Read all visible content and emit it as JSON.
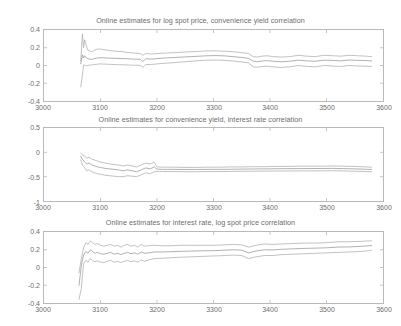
{
  "figure": {
    "width": 401,
    "height": 326,
    "background": "#ffffff",
    "axis_color": "#b9b9b9",
    "text_color": "#6d6d6d"
  },
  "chart_data": [
    {
      "type": "line",
      "title": "Online estimates for log spot price, convenience yield correlation",
      "xlabel": "",
      "ylabel": "",
      "xlim": [
        3000,
        3600
      ],
      "ylim": [
        -0.4,
        0.4
      ],
      "xticks": [
        3000,
        3100,
        3200,
        3300,
        3400,
        3500,
        3600
      ],
      "xticklabels": [
        "3000",
        "3100",
        "3200",
        "3300",
        "3400",
        "3500",
        "3600"
      ],
      "yticks": [
        -0.4,
        -0.2,
        0,
        0.2,
        0.4
      ],
      "yticklabels": [
        "-0.4",
        "-0.2",
        "0",
        "0.2",
        "0.4"
      ],
      "grid": false,
      "legend": "none",
      "line_color": "#9a9a9a",
      "series": [
        {
          "name": "upper confidence band",
          "color": "#a8a8a8",
          "x": [
            3065,
            3068,
            3070,
            3072,
            3075,
            3078,
            3082,
            3086,
            3090,
            3095,
            3100,
            3110,
            3120,
            3130,
            3140,
            3150,
            3160,
            3170,
            3175,
            3180,
            3190,
            3200,
            3215,
            3230,
            3245,
            3260,
            3275,
            3290,
            3305,
            3320,
            3335,
            3350,
            3362,
            3370,
            3378,
            3385,
            3395,
            3405,
            3420,
            3435,
            3450,
            3465,
            3480,
            3495,
            3510,
            3525,
            3540,
            3555,
            3570,
            3580
          ],
          "values": [
            0.05,
            0.355,
            0.2,
            0.29,
            0.22,
            0.17,
            0.16,
            0.155,
            0.175,
            0.185,
            0.185,
            0.175,
            0.165,
            0.16,
            0.155,
            0.145,
            0.14,
            0.135,
            0.115,
            0.135,
            0.13,
            0.135,
            0.14,
            0.145,
            0.15,
            0.155,
            0.16,
            0.165,
            0.165,
            0.16,
            0.155,
            0.145,
            0.135,
            0.1,
            0.095,
            0.105,
            0.11,
            0.1,
            0.095,
            0.1,
            0.115,
            0.105,
            0.1,
            0.115,
            0.11,
            0.105,
            0.115,
            0.11,
            0.105,
            0.1
          ]
        },
        {
          "name": "point estimate",
          "color": "#8f8f8f",
          "x": [
            3065,
            3068,
            3070,
            3072,
            3075,
            3078,
            3082,
            3086,
            3090,
            3095,
            3100,
            3110,
            3120,
            3130,
            3140,
            3150,
            3160,
            3170,
            3175,
            3180,
            3190,
            3200,
            3215,
            3230,
            3245,
            3260,
            3275,
            3290,
            3305,
            3320,
            3335,
            3350,
            3362,
            3370,
            3378,
            3385,
            3395,
            3405,
            3420,
            3435,
            3450,
            3465,
            3480,
            3495,
            3510,
            3525,
            3540,
            3555,
            3570,
            3580
          ],
          "values": [
            0.02,
            0.12,
            0.085,
            0.11,
            0.085,
            0.075,
            0.07,
            0.072,
            0.08,
            0.085,
            0.088,
            0.085,
            0.082,
            0.08,
            0.078,
            0.075,
            0.072,
            0.07,
            0.045,
            0.075,
            0.072,
            0.078,
            0.085,
            0.09,
            0.095,
            0.1,
            0.105,
            0.11,
            0.112,
            0.108,
            0.1,
            0.09,
            0.08,
            0.05,
            0.042,
            0.05,
            0.055,
            0.048,
            0.042,
            0.048,
            0.06,
            0.052,
            0.048,
            0.06,
            0.058,
            0.052,
            0.062,
            0.058,
            0.055,
            0.052
          ]
        },
        {
          "name": "lower confidence band",
          "color": "#a8a8a8",
          "x": [
            3065,
            3068,
            3070,
            3072,
            3075,
            3078,
            3082,
            3086,
            3090,
            3095,
            3100,
            3110,
            3120,
            3130,
            3140,
            3150,
            3160,
            3170,
            3175,
            3180,
            3190,
            3200,
            3215,
            3230,
            3245,
            3260,
            3275,
            3290,
            3305,
            3320,
            3335,
            3350,
            3362,
            3370,
            3378,
            3385,
            3395,
            3405,
            3420,
            3435,
            3450,
            3465,
            3480,
            3495,
            3510,
            3525,
            3540,
            3555,
            3570,
            3580
          ],
          "values": [
            -0.24,
            -0.11,
            0.005,
            0.005,
            -0.005,
            0.0,
            0.005,
            0.008,
            0.012,
            0.015,
            0.018,
            0.015,
            0.012,
            0.01,
            0.008,
            0.005,
            0.003,
            0.002,
            -0.02,
            0.01,
            0.012,
            0.018,
            0.025,
            0.032,
            0.04,
            0.048,
            0.055,
            0.06,
            0.062,
            0.058,
            0.05,
            0.04,
            0.03,
            -0.015,
            -0.02,
            -0.012,
            -0.008,
            -0.015,
            -0.022,
            -0.015,
            0.0,
            -0.01,
            -0.015,
            0.0,
            -0.005,
            -0.012,
            0.0,
            -0.005,
            -0.008,
            -0.01
          ]
        }
      ]
    },
    {
      "type": "line",
      "title": "Online estimates for convenience yield, interest rate correlation",
      "xlabel": "",
      "ylabel": "",
      "xlim": [
        3000,
        3600
      ],
      "ylim": [
        -1,
        0.5
      ],
      "xticks": [
        3000,
        3100,
        3200,
        3300,
        3400,
        3500,
        3600
      ],
      "xticklabels": [
        "3000",
        "3100",
        "3200",
        "3300",
        "3400",
        "3500",
        "3600"
      ],
      "yticks": [
        -1,
        -0.5,
        0,
        0.5
      ],
      "yticklabels": [
        "-1",
        "-0.5",
        "0",
        "0.5"
      ],
      "grid": false,
      "legend": "none",
      "line_color": "#9a9a9a",
      "series": [
        {
          "name": "upper confidence band",
          "color": "#a8a8a8",
          "x": [
            3065,
            3068,
            3072,
            3076,
            3080,
            3085,
            3090,
            3095,
            3100,
            3108,
            3116,
            3124,
            3132,
            3140,
            3148,
            3156,
            3164,
            3172,
            3180,
            3188,
            3195,
            3200,
            3210,
            3230,
            3250,
            3270,
            3290,
            3310,
            3330,
            3350,
            3370,
            3390,
            3410,
            3430,
            3450,
            3470,
            3490,
            3510,
            3530,
            3550,
            3570,
            3580
          ],
          "values": [
            -0.02,
            -0.05,
            -0.08,
            -0.12,
            -0.1,
            -0.14,
            -0.16,
            -0.18,
            -0.2,
            -0.22,
            -0.24,
            -0.25,
            -0.26,
            -0.28,
            -0.26,
            -0.28,
            -0.3,
            -0.26,
            -0.22,
            -0.24,
            -0.2,
            -0.3,
            -0.305,
            -0.305,
            -0.31,
            -0.31,
            -0.305,
            -0.305,
            -0.3,
            -0.3,
            -0.295,
            -0.295,
            -0.29,
            -0.29,
            -0.285,
            -0.285,
            -0.285,
            -0.28,
            -0.285,
            -0.29,
            -0.3,
            -0.305
          ]
        },
        {
          "name": "point estimate",
          "color": "#8f8f8f",
          "x": [
            3065,
            3068,
            3072,
            3076,
            3080,
            3085,
            3090,
            3095,
            3100,
            3108,
            3116,
            3124,
            3132,
            3140,
            3148,
            3156,
            3164,
            3172,
            3180,
            3188,
            3195,
            3200,
            3210,
            3230,
            3250,
            3270,
            3290,
            3310,
            3330,
            3350,
            3370,
            3390,
            3410,
            3430,
            3450,
            3470,
            3490,
            3510,
            3530,
            3550,
            3570,
            3580
          ],
          "values": [
            -0.08,
            -0.14,
            -0.2,
            -0.24,
            -0.22,
            -0.26,
            -0.28,
            -0.3,
            -0.31,
            -0.33,
            -0.34,
            -0.35,
            -0.36,
            -0.38,
            -0.36,
            -0.38,
            -0.4,
            -0.36,
            -0.32,
            -0.34,
            -0.3,
            -0.345,
            -0.35,
            -0.35,
            -0.352,
            -0.352,
            -0.35,
            -0.35,
            -0.348,
            -0.345,
            -0.342,
            -0.34,
            -0.338,
            -0.335,
            -0.335,
            -0.332,
            -0.332,
            -0.33,
            -0.335,
            -0.34,
            -0.348,
            -0.352
          ]
        },
        {
          "name": "lower confidence band",
          "color": "#a8a8a8",
          "x": [
            3065,
            3068,
            3072,
            3076,
            3080,
            3085,
            3090,
            3095,
            3100,
            3108,
            3116,
            3124,
            3132,
            3140,
            3148,
            3156,
            3164,
            3172,
            3180,
            3188,
            3195,
            3200,
            3210,
            3230,
            3250,
            3270,
            3290,
            3310,
            3330,
            3350,
            3370,
            3390,
            3410,
            3430,
            3450,
            3470,
            3490,
            3510,
            3530,
            3550,
            3570,
            3580
          ],
          "values": [
            -0.16,
            -0.26,
            -0.32,
            -0.38,
            -0.36,
            -0.4,
            -0.42,
            -0.44,
            -0.45,
            -0.47,
            -0.48,
            -0.49,
            -0.5,
            -0.5,
            -0.48,
            -0.49,
            -0.5,
            -0.46,
            -0.42,
            -0.44,
            -0.4,
            -0.39,
            -0.395,
            -0.395,
            -0.398,
            -0.398,
            -0.395,
            -0.395,
            -0.392,
            -0.39,
            -0.388,
            -0.386,
            -0.384,
            -0.382,
            -0.382,
            -0.38,
            -0.38,
            -0.378,
            -0.382,
            -0.388,
            -0.395,
            -0.4
          ]
        }
      ]
    },
    {
      "type": "line",
      "title": "Online estimates for interest rate, log spot price correlation",
      "xlabel": "",
      "ylabel": "",
      "xlim": [
        3000,
        3600
      ],
      "ylim": [
        -0.4,
        0.4
      ],
      "xticks": [
        3000,
        3100,
        3200,
        3300,
        3400,
        3500,
        3600
      ],
      "xticklabels": [
        "3000",
        "3100",
        "3200",
        "3300",
        "3400",
        "3500",
        "3600"
      ],
      "yticks": [
        -0.4,
        -0.2,
        0,
        0.2,
        0.4
      ],
      "yticklabels": [
        "-0.4",
        "-0.2",
        "0",
        "0.2",
        "0.4"
      ],
      "grid": false,
      "legend": "none",
      "line_color": "#9a9a9a",
      "series": [
        {
          "name": "upper confidence band",
          "color": "#a8a8a8",
          "x": [
            3062,
            3066,
            3070,
            3074,
            3078,
            3082,
            3086,
            3090,
            3095,
            3100,
            3106,
            3112,
            3118,
            3124,
            3130,
            3136,
            3142,
            3148,
            3154,
            3160,
            3166,
            3172,
            3178,
            3185,
            3195,
            3210,
            3225,
            3240,
            3260,
            3280,
            3300,
            3320,
            3335,
            3350,
            3362,
            3375,
            3390,
            3405,
            3420,
            3440,
            3460,
            3480,
            3500,
            3520,
            3540,
            3560,
            3575,
            3580
          ],
          "values": [
            -0.06,
            0.1,
            0.22,
            0.28,
            0.26,
            0.3,
            0.28,
            0.26,
            0.27,
            0.25,
            0.24,
            0.25,
            0.26,
            0.24,
            0.25,
            0.23,
            0.25,
            0.26,
            0.24,
            0.25,
            0.23,
            0.26,
            0.24,
            0.245,
            0.25,
            0.245,
            0.245,
            0.25,
            0.25,
            0.25,
            0.25,
            0.255,
            0.26,
            0.255,
            0.23,
            0.25,
            0.265,
            0.26,
            0.265,
            0.27,
            0.275,
            0.275,
            0.28,
            0.29,
            0.29,
            0.295,
            0.3,
            0.3
          ]
        },
        {
          "name": "point estimate",
          "color": "#8f8f8f",
          "x": [
            3062,
            3066,
            3070,
            3074,
            3078,
            3082,
            3086,
            3090,
            3095,
            3100,
            3106,
            3112,
            3118,
            3124,
            3130,
            3136,
            3142,
            3148,
            3154,
            3160,
            3166,
            3172,
            3178,
            3185,
            3195,
            3210,
            3225,
            3240,
            3260,
            3280,
            3300,
            3320,
            3335,
            3350,
            3362,
            3375,
            3390,
            3405,
            3420,
            3440,
            3460,
            3480,
            3500,
            3520,
            3540,
            3560,
            3575,
            3580
          ],
          "values": [
            -0.2,
            0.02,
            0.14,
            0.18,
            0.16,
            0.2,
            0.18,
            0.16,
            0.17,
            0.155,
            0.15,
            0.16,
            0.17,
            0.15,
            0.16,
            0.145,
            0.16,
            0.17,
            0.155,
            0.165,
            0.15,
            0.175,
            0.16,
            0.165,
            0.175,
            0.175,
            0.178,
            0.182,
            0.185,
            0.188,
            0.19,
            0.195,
            0.2,
            0.195,
            0.165,
            0.185,
            0.2,
            0.198,
            0.205,
            0.21,
            0.215,
            0.218,
            0.222,
            0.23,
            0.232,
            0.238,
            0.245,
            0.248
          ]
        },
        {
          "name": "lower confidence band",
          "color": "#a8a8a8",
          "x": [
            3062,
            3066,
            3070,
            3074,
            3078,
            3082,
            3086,
            3090,
            3095,
            3100,
            3106,
            3112,
            3118,
            3124,
            3130,
            3136,
            3142,
            3148,
            3154,
            3160,
            3166,
            3172,
            3178,
            3185,
            3195,
            3210,
            3225,
            3240,
            3260,
            3280,
            3300,
            3320,
            3335,
            3350,
            3362,
            3375,
            3390,
            3405,
            3420,
            3440,
            3460,
            3480,
            3500,
            3520,
            3540,
            3560,
            3575,
            3580
          ],
          "values": [
            -0.36,
            -0.24,
            0.04,
            0.08,
            0.06,
            0.1,
            0.08,
            0.065,
            0.075,
            0.06,
            0.055,
            0.07,
            0.08,
            0.06,
            0.07,
            0.055,
            0.07,
            0.08,
            0.065,
            0.075,
            0.06,
            0.085,
            0.07,
            0.085,
            0.1,
            0.105,
            0.11,
            0.115,
            0.12,
            0.125,
            0.13,
            0.135,
            0.14,
            0.135,
            0.1,
            0.12,
            0.135,
            0.135,
            0.145,
            0.15,
            0.155,
            0.16,
            0.165,
            0.17,
            0.175,
            0.18,
            0.19,
            0.195
          ]
        }
      ]
    }
  ]
}
